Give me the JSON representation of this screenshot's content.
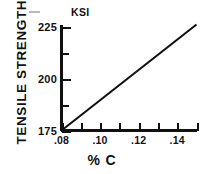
{
  "chart_data": {
    "type": "line",
    "title": "",
    "subtitle": "",
    "xlabel": "% C",
    "ylabel": "TENSILE STRENGTH",
    "yunit": "KSI",
    "xlim": [
      0.08,
      0.15
    ],
    "ylim": [
      175,
      226
    ],
    "grid": false,
    "legend": null,
    "x_major_ticks": [
      0.08,
      0.1,
      0.12,
      0.14
    ],
    "x_major_tick_labels": [
      ".08",
      ".10",
      ".12",
      ".14"
    ],
    "x_minor_ticks": [
      0.09,
      0.11,
      0.13,
      0.15
    ],
    "y_major_ticks": [
      175,
      200,
      225
    ],
    "y_major_tick_labels": [
      "175",
      "200",
      "225"
    ],
    "y_minor_ticks": [
      187.5,
      212.5
    ],
    "series": [
      {
        "name": "tensile strength vs carbon content",
        "x": [
          0.08,
          0.15
        ],
        "values": [
          175,
          226
        ]
      }
    ],
    "annotations": []
  },
  "axes": {
    "y_title": "TENSILE STRENGTH",
    "y_unit": "KSI",
    "x_title": "% C"
  }
}
